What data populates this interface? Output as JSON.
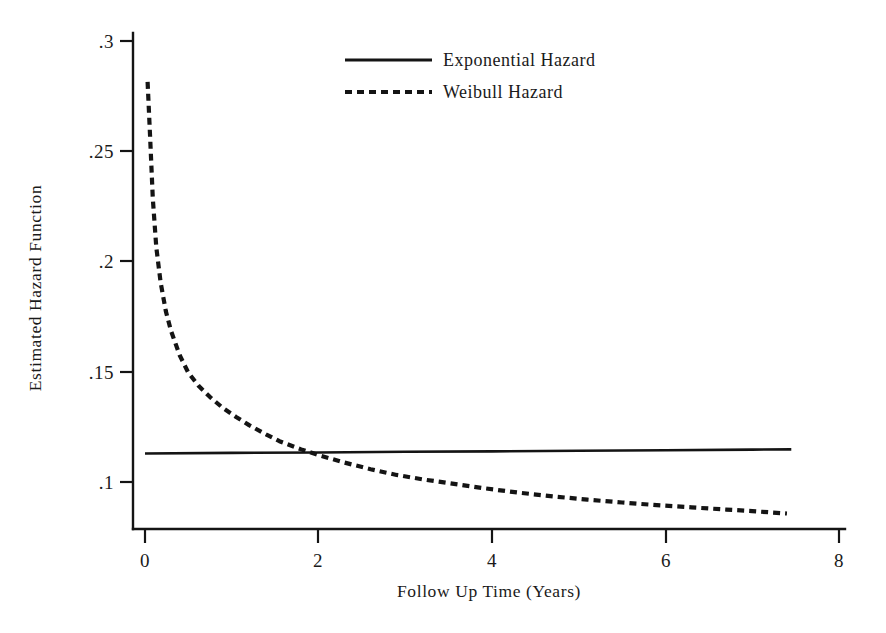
{
  "chart_data": {
    "type": "line",
    "title": "",
    "xlabel": "Follow Up Time (Years)",
    "ylabel": "Estimated Hazard Function",
    "xlim": [
      0,
      8
    ],
    "ylim": [
      0.08,
      0.3
    ],
    "grid": false,
    "legend_position": "top-center",
    "xticks": [
      {
        "value": 0,
        "label": "0"
      },
      {
        "value": 2,
        "label": "2"
      },
      {
        "value": 4,
        "label": "4"
      },
      {
        "value": 6,
        "label": "6"
      },
      {
        "value": 8,
        "label": "8"
      }
    ],
    "yticks": [
      {
        "value": 0.3,
        "label": ".3"
      },
      {
        "value": 0.25,
        "label": ".25"
      },
      {
        "value": 0.2,
        "label": ".2"
      },
      {
        "value": 0.15,
        "label": ".15"
      },
      {
        "value": 0.1,
        "label": ".1"
      }
    ],
    "series": [
      {
        "name": "Exponential Hazard",
        "style": "solid",
        "color": "#141414",
        "x": [
          0.0,
          1.0,
          2.0,
          3.0,
          4.0,
          5.0,
          6.0,
          7.0,
          7.45
        ],
        "values": [
          0.1129,
          0.1132,
          0.1134,
          0.1137,
          0.1139,
          0.1142,
          0.1144,
          0.1147,
          0.1148
        ]
      },
      {
        "name": "Weibull Hazard",
        "style": "dashed",
        "color": "#141414",
        "x": [
          0.03,
          0.06,
          0.09,
          0.13,
          0.18,
          0.24,
          0.3,
          0.4,
          0.5,
          0.62,
          0.75,
          0.9,
          1.05,
          1.2,
          1.4,
          1.55,
          1.8,
          2.0,
          2.3,
          2.6,
          2.9,
          3.2,
          3.5,
          3.9,
          4.3,
          4.7,
          5.1,
          5.5,
          5.9,
          6.3,
          6.7,
          7.0,
          7.4
        ],
        "values": [
          0.2815,
          0.2555,
          0.2285,
          0.2065,
          0.1905,
          0.1775,
          0.1685,
          0.1575,
          0.1495,
          0.1435,
          0.1385,
          0.1335,
          0.1295,
          0.1258,
          0.1215,
          0.1185,
          0.1148,
          0.1122,
          0.1088,
          0.1058,
          0.1032,
          0.1012,
          0.0995,
          0.0972,
          0.0952,
          0.0935,
          0.092,
          0.0907,
          0.0895,
          0.0885,
          0.0875,
          0.0868,
          0.0857
        ]
      }
    ],
    "annotations": []
  },
  "legend": {
    "entries": [
      {
        "label": "Exponential Hazard",
        "style": "solid"
      },
      {
        "label": "Weibull Hazard",
        "style": "dashed"
      }
    ]
  },
  "axes": {
    "x_title": "Follow Up Time (Years)",
    "y_title": "Estimated Hazard Function",
    "x_tick_labels": [
      "0",
      "2",
      "4",
      "6",
      "8"
    ],
    "y_tick_labels": [
      ".3",
      ".25",
      ".2",
      ".15",
      ".1"
    ]
  }
}
